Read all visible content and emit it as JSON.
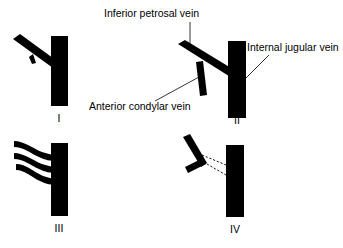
{
  "figure": {
    "background_color": "#ffffff",
    "vessel_color": "#000000",
    "line_color": "#000000"
  },
  "labels": {
    "inferior_petrosal_vein": "Inferior petrosal vein",
    "internal_jugular_vein": "Internal jugular vein",
    "anterior_condylar_vein": "Anterior condylar vein"
  },
  "panels": [
    {
      "id": "panel-1",
      "numeral": "I",
      "description": "Single inferior petrosal vein entering the internal jugular vein with a small tributary"
    },
    {
      "id": "panel-2",
      "numeral": "II",
      "description": "Inferior petrosal vein joined by a descending anterior condylar vein before entering the internal jugular vein"
    },
    {
      "id": "panel-3",
      "numeral": "III",
      "description": "Plexiform pattern of three separate channels draining into the internal jugular vein"
    },
    {
      "id": "panel-4",
      "numeral": "IV",
      "description": "Absent or non-patent connection between the vein and the internal jugular vein, shown by dashed lines"
    }
  ],
  "icons": {
    "vessel": "vessel-segment-icon",
    "dashed_connection": "dashed-connection-icon"
  }
}
